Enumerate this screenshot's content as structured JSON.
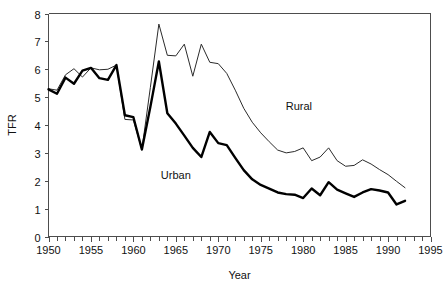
{
  "chart_data": {
    "type": "line",
    "title": "",
    "xlabel": "Year",
    "ylabel": "TFR",
    "xlim": [
      1950,
      1995
    ],
    "ylim": [
      0,
      8
    ],
    "grid": false,
    "legend_position": "inline-annotations",
    "x_tick_labels": [
      "1950",
      "1955",
      "1960",
      "1965",
      "1970",
      "1975",
      "1980",
      "1985",
      "1990",
      "1995"
    ],
    "x_tick_values": [
      1950,
      1955,
      1960,
      1965,
      1970,
      1975,
      1980,
      1985,
      1990,
      1995
    ],
    "x_minor_tick_step": 1,
    "y_tick_labels": [
      "0",
      "1",
      "2",
      "3",
      "4",
      "5",
      "6",
      "7",
      "8"
    ],
    "y_tick_values": [
      0,
      1,
      2,
      3,
      4,
      5,
      6,
      7,
      8
    ],
    "x": [
      1950,
      1951,
      1952,
      1953,
      1954,
      1955,
      1956,
      1957,
      1958,
      1959,
      1960,
      1961,
      1962,
      1963,
      1964,
      1965,
      1966,
      1967,
      1968,
      1969,
      1970,
      1971,
      1972,
      1973,
      1974,
      1975,
      1976,
      1977,
      1978,
      1979,
      1980,
      1981,
      1982,
      1983,
      1984,
      1985,
      1986,
      1987,
      1988,
      1989,
      1990,
      1991,
      1992
    ],
    "series": [
      {
        "name": "Rural",
        "style": "thin-line",
        "color": "#2b2b2b",
        "label_x": 1979.5,
        "label_y": 4.55,
        "values": [
          5.3,
          5.25,
          5.8,
          6.02,
          5.72,
          6.05,
          5.98,
          6.0,
          6.15,
          4.2,
          4.18,
          3.12,
          5.35,
          7.62,
          6.5,
          6.48,
          6.9,
          5.75,
          6.9,
          6.25,
          6.2,
          5.85,
          5.25,
          4.6,
          4.1,
          3.72,
          3.4,
          3.1,
          3.0,
          3.05,
          3.18,
          2.72,
          2.85,
          3.18,
          2.72,
          2.52,
          2.55,
          2.75,
          2.6,
          2.4,
          2.22,
          1.98,
          1.75
        ]
      },
      {
        "name": "Urban",
        "style": "thick-line",
        "color": "#000000",
        "label_x": 1965.0,
        "label_y": 2.05,
        "values": [
          5.28,
          5.12,
          5.7,
          5.48,
          5.95,
          6.05,
          5.68,
          5.62,
          6.15,
          4.35,
          4.28,
          3.12,
          4.65,
          6.28,
          4.42,
          4.05,
          3.62,
          3.18,
          2.85,
          3.75,
          3.35,
          3.28,
          2.82,
          2.38,
          2.05,
          1.85,
          1.72,
          1.58,
          1.52,
          1.5,
          1.38,
          1.72,
          1.48,
          1.95,
          1.68,
          1.55,
          1.42,
          1.58,
          1.7,
          1.65,
          1.58,
          1.15,
          1.28
        ]
      }
    ]
  },
  "labels": {
    "rural": "Rural",
    "urban": "Urban",
    "x_axis_title": "Year",
    "y_axis_title": "TFR"
  }
}
